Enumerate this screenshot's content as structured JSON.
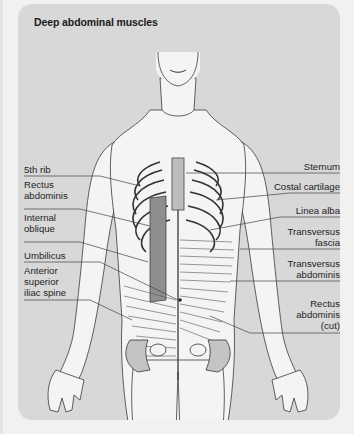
{
  "title": "Deep abdominal muscles",
  "colors": {
    "page_background": "#f1f1f1",
    "panel_background": "#d8d8d8",
    "figure_fill": "#f4f4f4",
    "line_ink": "#3a3a3a",
    "muscle_shade": "#9a9a9a",
    "label_text": "#1e1e1e"
  },
  "labels": {
    "left": [
      {
        "text": "5th rib"
      },
      {
        "text": "Rectus\nabdominis"
      },
      {
        "text": "Internal\noblique"
      },
      {
        "text": "Umbilicus"
      },
      {
        "text": "Anterior\nsuperior\niliac spine"
      }
    ],
    "right": [
      {
        "text": "Sternum"
      },
      {
        "text": "Costal cartilage"
      },
      {
        "text": "Linea alba"
      },
      {
        "text": "Transversus\nfascia"
      },
      {
        "text": "Transversus\nabdominis"
      },
      {
        "text": "Rectus\nabdominis\n(cut)"
      }
    ]
  }
}
